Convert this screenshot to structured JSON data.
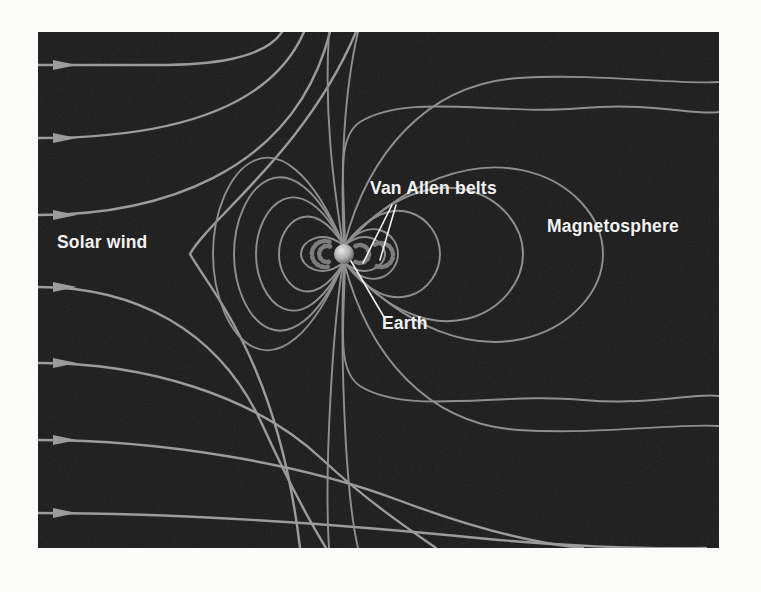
{
  "figure": {
    "labels": {
      "solar_wind": "Solar wind",
      "van_allen": "Van Allen belts",
      "magnetosphere": "Magnetosphere",
      "earth": "Earth"
    },
    "colors": {
      "page_background": "#fbfbfa",
      "background": "#1a1a1a",
      "field_line": "#8f8f8f",
      "solar_wind_line": "#9c9c9c",
      "pointer_line": "#f0f0f0",
      "label_text": "#f2f2f2",
      "belt": "#7d7d7d",
      "earth_highlight": "#e8e8e8",
      "earth_mid": "#aeaeae",
      "earth_shadow": "#555555"
    }
  }
}
